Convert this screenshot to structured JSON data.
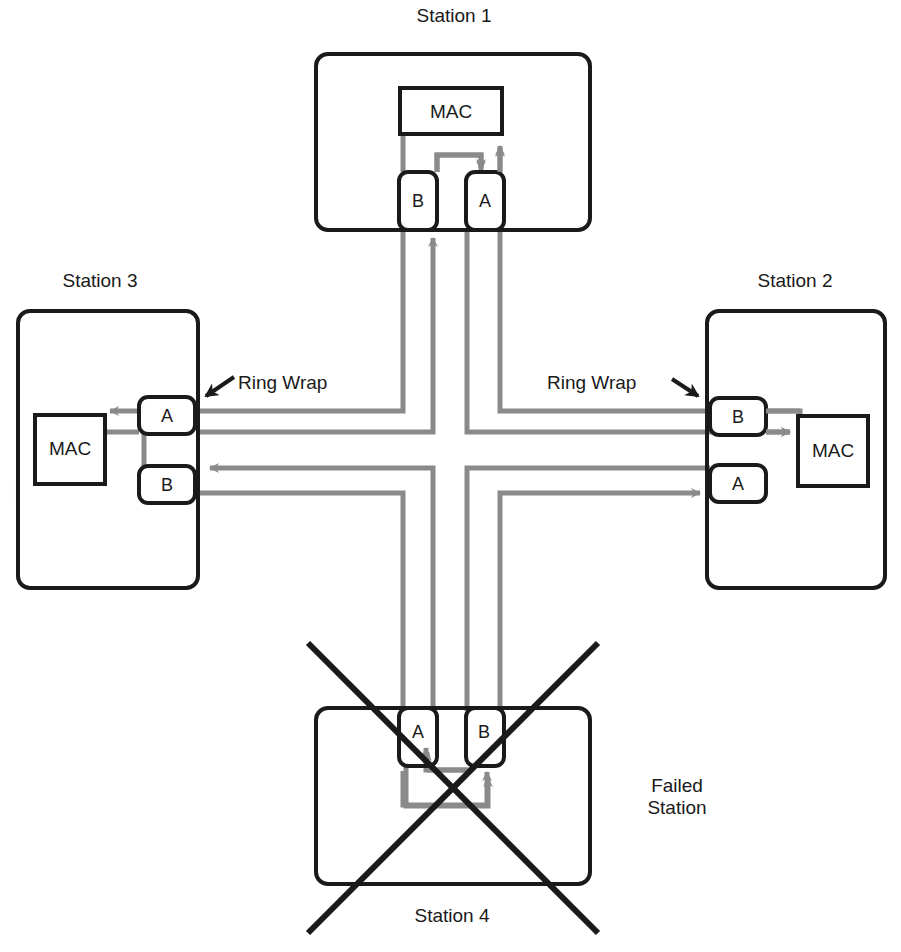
{
  "diagram": {
    "colors": {
      "outline": "#1a1a1a",
      "wire": "#8a8a8a",
      "background": "#ffffff"
    },
    "stations": [
      {
        "id": "station-1",
        "label": "Station 1",
        "mac_label": "MAC",
        "ports": [
          {
            "label": "B"
          },
          {
            "label": "A"
          }
        ]
      },
      {
        "id": "station-2",
        "label": "Station 2",
        "mac_label": "MAC",
        "ports": [
          {
            "label": "B"
          },
          {
            "label": "A"
          }
        ],
        "annotation": "Ring Wrap"
      },
      {
        "id": "station-3",
        "label": "Station 3",
        "mac_label": "MAC",
        "ports": [
          {
            "label": "A"
          },
          {
            "label": "B"
          }
        ],
        "annotation": "Ring Wrap"
      },
      {
        "id": "station-4",
        "label": "Station 4",
        "ports": [
          {
            "label": "A"
          },
          {
            "label": "B"
          }
        ],
        "status_line1": "Failed",
        "status_line2": "Station"
      }
    ]
  }
}
